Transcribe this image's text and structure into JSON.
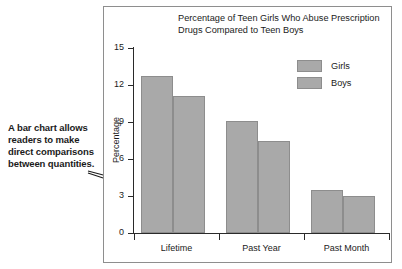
{
  "annotation": {
    "text": "A bar chart allows readers to make direct comparisons between quantities."
  },
  "legend": {
    "items": [
      {
        "label": "Girls",
        "color": "#a9a9a9"
      },
      {
        "label": "Boys",
        "color": "#a9a9a9"
      }
    ]
  },
  "chart_data": {
    "type": "bar",
    "title": "Percentage of Teen Girls Who Abuse Prescription Drugs Compared to Teen Boys",
    "xlabel": "",
    "ylabel": "Percentage",
    "categories": [
      "Lifetime",
      "Past Year",
      "Past Month"
    ],
    "series": [
      {
        "name": "Girls",
        "values": [
          12.7,
          9.1,
          3.5
        ],
        "color": "#a9a9a9"
      },
      {
        "name": "Boys",
        "values": [
          11.1,
          7.5,
          3.0
        ],
        "color": "#a9a9a9"
      }
    ],
    "ylim": [
      0,
      15
    ],
    "yticks": [
      0,
      3,
      6,
      9,
      12,
      15
    ],
    "ytick_labels": [
      "0",
      "3",
      "6",
      "9",
      "12",
      "15"
    ],
    "grid": false,
    "legend_position": "top-right"
  }
}
